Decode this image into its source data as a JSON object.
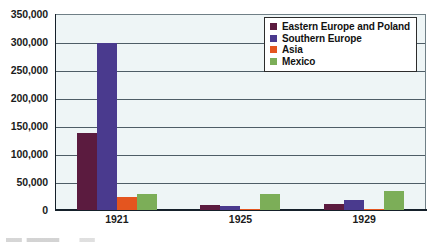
{
  "chart_data": {
    "type": "bar",
    "title": "",
    "xlabel": "",
    "ylabel": "",
    "categories": [
      "1921",
      "1925",
      "1929"
    ],
    "series": [
      {
        "name": "Eastern Europe and Poland",
        "color": "#5b1b3f",
        "values": [
          137000,
          9000,
          11000
        ]
      },
      {
        "name": "Southern Europe",
        "color": "#4a3a8e",
        "values": [
          299000,
          7000,
          18000
        ]
      },
      {
        "name": "Asia",
        "color": "#e4551f",
        "values": [
          24000,
          2000,
          1500
        ]
      },
      {
        "name": "Mexico",
        "color": "#7cae58",
        "values": [
          29000,
          29000,
          34000
        ]
      }
    ],
    "ylim": [
      0,
      350000
    ],
    "ytick_values": [
      0,
      50000,
      100000,
      150000,
      200000,
      250000,
      300000,
      350000
    ],
    "ytick_labels": [
      "0",
      "50,000",
      "100,000",
      "150,000",
      "200,000",
      "250,000",
      "300,000",
      "350,000"
    ],
    "grid": true,
    "legend_position": "top-right",
    "plot_background": "#eef5f6",
    "gridline_color": "#4e5d66",
    "axis_color": "#15202a"
  }
}
